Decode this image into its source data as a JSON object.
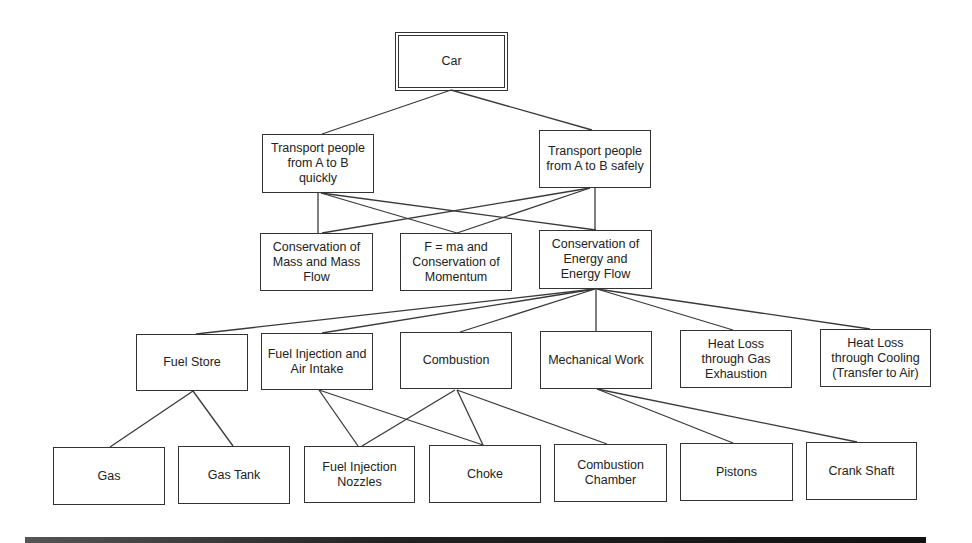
{
  "diagram": {
    "nodes": [
      {
        "id": "car",
        "label": "Car",
        "level": 1,
        "x": 398,
        "y": 35,
        "w": 107,
        "h": 53,
        "root": true
      },
      {
        "id": "quick",
        "label": "Transport people\nfrom A to B\nquickly",
        "level": 2,
        "x": 262,
        "y": 134,
        "w": 112,
        "h": 59
      },
      {
        "id": "safe",
        "label": "Transport people\nfrom A to B safely",
        "level": 2,
        "x": 539,
        "y": 130,
        "w": 112,
        "h": 58
      },
      {
        "id": "mass",
        "label": "Conservation of\nMass and Mass\nFlow",
        "level": 3,
        "x": 260,
        "y": 233,
        "w": 113,
        "h": 58
      },
      {
        "id": "fma",
        "label": "F = ma and\nConservation of\nMomentum",
        "level": 3,
        "x": 400,
        "y": 233,
        "w": 112,
        "h": 58
      },
      {
        "id": "energy",
        "label": "Conservation of\nEnergy and\nEnergy Flow",
        "level": 3,
        "x": 539,
        "y": 230,
        "w": 113,
        "h": 59
      },
      {
        "id": "fuelstore",
        "label": "Fuel Store",
        "level": 4,
        "x": 136,
        "y": 334,
        "w": 112,
        "h": 57
      },
      {
        "id": "fuelinj",
        "label": "Fuel Injection and\nAir Intake",
        "level": 4,
        "x": 261,
        "y": 333,
        "w": 112,
        "h": 57
      },
      {
        "id": "combustion",
        "label": "Combustion",
        "level": 4,
        "x": 400,
        "y": 332,
        "w": 112,
        "h": 57
      },
      {
        "id": "mech",
        "label": "Mechanical Work",
        "level": 4,
        "x": 540,
        "y": 331,
        "w": 112,
        "h": 58
      },
      {
        "id": "heatgas",
        "label": "Heat Loss\nthrough Gas\nExhaustion",
        "level": 4,
        "x": 680,
        "y": 330,
        "w": 112,
        "h": 58
      },
      {
        "id": "heatcool",
        "label": "Heat Loss\nthrough Cooling\n(Transfer to Air)",
        "level": 4,
        "x": 820,
        "y": 329,
        "w": 111,
        "h": 58
      },
      {
        "id": "gas",
        "label": "Gas",
        "level": 5,
        "x": 53,
        "y": 447,
        "w": 112,
        "h": 58
      },
      {
        "id": "gastank",
        "label": "Gas Tank",
        "level": 5,
        "x": 178,
        "y": 446,
        "w": 112,
        "h": 58
      },
      {
        "id": "nozzles",
        "label": "Fuel Injection\nNozzles",
        "level": 5,
        "x": 304,
        "y": 446,
        "w": 111,
        "h": 57
      },
      {
        "id": "choke",
        "label": "Choke",
        "level": 5,
        "x": 429,
        "y": 445,
        "w": 112,
        "h": 58
      },
      {
        "id": "chamber",
        "label": "Combustion\nChamber",
        "level": 5,
        "x": 554,
        "y": 444,
        "w": 113,
        "h": 58
      },
      {
        "id": "pistons",
        "label": "Pistons",
        "level": 5,
        "x": 680,
        "y": 443,
        "w": 113,
        "h": 58
      },
      {
        "id": "crank",
        "label": "Crank Shaft",
        "level": 5,
        "x": 806,
        "y": 442,
        "w": 111,
        "h": 58
      }
    ],
    "edges": [
      {
        "from": "car",
        "to": "quick",
        "x1": 451,
        "y1": 90,
        "x2": 322,
        "y2": 134
      },
      {
        "from": "car",
        "to": "safe",
        "x1": 451,
        "y1": 90,
        "x2": 592,
        "y2": 130
      },
      {
        "from": "quick",
        "to": "mass",
        "x1": 318,
        "y1": 193,
        "x2": 318,
        "y2": 233
      },
      {
        "from": "quick",
        "to": "fma",
        "x1": 321,
        "y1": 193,
        "x2": 457,
        "y2": 233
      },
      {
        "from": "quick",
        "to": "energy",
        "x1": 321,
        "y1": 193,
        "x2": 596,
        "y2": 230
      },
      {
        "from": "safe",
        "to": "mass",
        "x1": 590,
        "y1": 188,
        "x2": 322,
        "y2": 233
      },
      {
        "from": "safe",
        "to": "fma",
        "x1": 590,
        "y1": 188,
        "x2": 457,
        "y2": 233
      },
      {
        "from": "safe",
        "to": "energy",
        "x1": 595,
        "y1": 188,
        "x2": 595,
        "y2": 230
      },
      {
        "from": "energy",
        "to": "fuelstore",
        "x1": 595,
        "y1": 289,
        "x2": 196,
        "y2": 334
      },
      {
        "from": "energy",
        "to": "fuelinj",
        "x1": 595,
        "y1": 289,
        "x2": 322,
        "y2": 333
      },
      {
        "from": "energy",
        "to": "combustion",
        "x1": 595,
        "y1": 289,
        "x2": 460,
        "y2": 332
      },
      {
        "from": "energy",
        "to": "mech",
        "x1": 596,
        "y1": 289,
        "x2": 596,
        "y2": 331
      },
      {
        "from": "energy",
        "to": "heatgas",
        "x1": 597,
        "y1": 289,
        "x2": 733,
        "y2": 330
      },
      {
        "from": "energy",
        "to": "heatcool",
        "x1": 597,
        "y1": 289,
        "x2": 870,
        "y2": 329
      },
      {
        "from": "fuelstore",
        "to": "gas",
        "x1": 193,
        "y1": 391,
        "x2": 110,
        "y2": 447
      },
      {
        "from": "fuelstore",
        "to": "gastank",
        "x1": 193,
        "y1": 391,
        "x2": 233,
        "y2": 446
      },
      {
        "from": "fuelinj",
        "to": "nozzles",
        "x1": 319,
        "y1": 390,
        "x2": 358,
        "y2": 446
      },
      {
        "from": "fuelinj",
        "to": "choke",
        "x1": 319,
        "y1": 390,
        "x2": 483,
        "y2": 445
      },
      {
        "from": "combustion",
        "to": "nozzles",
        "x1": 455,
        "y1": 390,
        "x2": 362,
        "y2": 446
      },
      {
        "from": "combustion",
        "to": "choke",
        "x1": 457,
        "y1": 390,
        "x2": 483,
        "y2": 445
      },
      {
        "from": "combustion",
        "to": "chamber",
        "x1": 457,
        "y1": 390,
        "x2": 607,
        "y2": 444
      },
      {
        "from": "mech",
        "to": "pistons",
        "x1": 597,
        "y1": 389,
        "x2": 733,
        "y2": 443
      },
      {
        "from": "mech",
        "to": "crank",
        "x1": 597,
        "y1": 389,
        "x2": 857,
        "y2": 442
      }
    ]
  },
  "colors": {
    "line": "#3a3a3a",
    "border": "#333333",
    "background": "#ffffff",
    "text": "#222222"
  }
}
